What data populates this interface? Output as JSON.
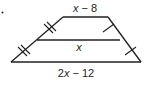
{
  "figure": {
    "type": "trapezoid-midsegment",
    "bullet": "•",
    "labels": {
      "top_base": {
        "var": "x",
        "rest": " − 8"
      },
      "midsegment": {
        "var": "x",
        "rest": ""
      },
      "bottom_base": {
        "num": "2",
        "var": "x",
        "rest": " − 12"
      }
    },
    "tick_marks": {
      "left_legs": "double",
      "right_legs": "single"
    },
    "colors": {
      "stroke": "#231f20",
      "background": "#ffffff"
    }
  }
}
